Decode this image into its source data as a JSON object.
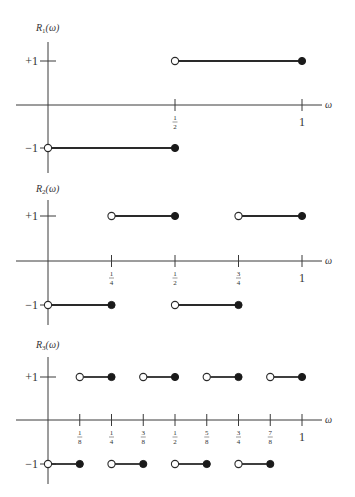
{
  "chart_data": [
    {
      "type": "line",
      "title": "R_1(ω)",
      "title_base": "R",
      "title_sub": "1",
      "title_arg": "(ω)",
      "xlabel": "ω",
      "ylabel": "R_1(ω)",
      "yticks": [
        {
          "value": 1,
          "label": "+1"
        },
        {
          "value": -1,
          "label": "−1"
        }
      ],
      "xticks": [
        {
          "value": 0.5,
          "num": "1",
          "den": "2"
        },
        {
          "value": 1,
          "label": "1"
        }
      ],
      "xlim": [
        0,
        1
      ],
      "ylim": [
        -1,
        1
      ],
      "segments": [
        {
          "x0": 0,
          "x1": 0.5,
          "y": -1,
          "left": "open",
          "right": "closed"
        },
        {
          "x0": 0.5,
          "x1": 1,
          "y": 1,
          "left": "open",
          "right": "closed"
        }
      ]
    },
    {
      "type": "line",
      "title": "R_2(ω)",
      "title_base": "R",
      "title_sub": "2",
      "title_arg": "(ω)",
      "xlabel": "ω",
      "ylabel": "R_2(ω)",
      "yticks": [
        {
          "value": 1,
          "label": "+1"
        },
        {
          "value": -1,
          "label": "−1"
        }
      ],
      "xticks": [
        {
          "value": 0.25,
          "num": "1",
          "den": "4"
        },
        {
          "value": 0.5,
          "num": "1",
          "den": "2"
        },
        {
          "value": 0.75,
          "num": "3",
          "den": "4"
        },
        {
          "value": 1,
          "label": "1"
        }
      ],
      "xlim": [
        0,
        1
      ],
      "ylim": [
        -1,
        1
      ],
      "segments": [
        {
          "x0": 0,
          "x1": 0.25,
          "y": -1,
          "left": "open",
          "right": "closed"
        },
        {
          "x0": 0.25,
          "x1": 0.5,
          "y": 1,
          "left": "open",
          "right": "closed"
        },
        {
          "x0": 0.5,
          "x1": 0.75,
          "y": -1,
          "left": "open",
          "right": "closed"
        },
        {
          "x0": 0.75,
          "x1": 1,
          "y": 1,
          "left": "open",
          "right": "closed"
        }
      ]
    },
    {
      "type": "line",
      "title": "R_3(ω)",
      "title_base": "R",
      "title_sub": "3",
      "title_arg": "(ω)",
      "xlabel": "ω",
      "ylabel": "R_3(ω)",
      "yticks": [
        {
          "value": 1,
          "label": "+1"
        },
        {
          "value": -1,
          "label": "−1"
        }
      ],
      "xticks": [
        {
          "value": 0.125,
          "num": "1",
          "den": "8"
        },
        {
          "value": 0.25,
          "num": "1",
          "den": "4"
        },
        {
          "value": 0.375,
          "num": "3",
          "den": "8"
        },
        {
          "value": 0.5,
          "num": "1",
          "den": "2"
        },
        {
          "value": 0.625,
          "num": "5",
          "den": "8"
        },
        {
          "value": 0.75,
          "num": "3",
          "den": "4"
        },
        {
          "value": 0.875,
          "num": "7",
          "den": "8"
        },
        {
          "value": 1,
          "label": "1"
        }
      ],
      "xlim": [
        0,
        1
      ],
      "ylim": [
        -1,
        1
      ],
      "segments": [
        {
          "x0": 0,
          "x1": 0.125,
          "y": -1,
          "left": "open",
          "right": "closed"
        },
        {
          "x0": 0.125,
          "x1": 0.25,
          "y": 1,
          "left": "open",
          "right": "closed"
        },
        {
          "x0": 0.25,
          "x1": 0.375,
          "y": -1,
          "left": "open",
          "right": "closed"
        },
        {
          "x0": 0.375,
          "x1": 0.5,
          "y": 1,
          "left": "open",
          "right": "closed"
        },
        {
          "x0": 0.5,
          "x1": 0.625,
          "y": -1,
          "left": "open",
          "right": "closed"
        },
        {
          "x0": 0.625,
          "x1": 0.75,
          "y": 1,
          "left": "open",
          "right": "closed"
        },
        {
          "x0": 0.75,
          "x1": 0.875,
          "y": -1,
          "left": "open",
          "right": "closed"
        },
        {
          "x0": 0.875,
          "x1": 1,
          "y": 1,
          "left": "open",
          "right": "closed"
        }
      ]
    }
  ],
  "layout": {
    "x_origin": 48,
    "x_one": 302,
    "panels": [
      {
        "axis_top": 42,
        "axis_bottom": 173,
        "y_plus": 61,
        "y_zero": 105,
        "y_minus": 148,
        "title_y": 31
      },
      {
        "axis_top": 200,
        "axis_bottom": 325,
        "y_plus": 216,
        "y_zero": 261,
        "y_minus": 305,
        "title_y": 192
      },
      {
        "axis_top": 357,
        "axis_bottom": 484,
        "y_plus": 377,
        "y_zero": 420,
        "y_minus": 464,
        "title_y": 348
      }
    ]
  }
}
